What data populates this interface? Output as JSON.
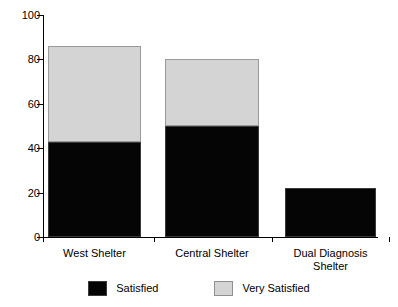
{
  "chart_data": {
    "type": "bar",
    "subtype": "stacked-vertical",
    "title": "",
    "subtitle": "",
    "xlabel": "",
    "ylabel": "",
    "categories": [
      "West Shelter",
      "Central Shelter",
      "Dual Diagnosis\nShelter"
    ],
    "series": [
      {
        "name": "Satisfied",
        "color": "#050505",
        "values": [
          43,
          50,
          22
        ]
      },
      {
        "name": "Very Satisfied",
        "color": "#d4d4d4",
        "values": [
          43,
          30,
          0
        ]
      }
    ],
    "totals": [
      86,
      80,
      22
    ],
    "ylim": [
      0,
      100
    ],
    "yticks": [
      0,
      20,
      40,
      60,
      80,
      100
    ],
    "ytick_labels": [
      "0",
      "20",
      "40",
      "60",
      "80",
      "100"
    ],
    "grid": false,
    "legend_position": "bottom",
    "legend": [
      {
        "label": "Satisfied",
        "swatch": "black"
      },
      {
        "label": "Very Satisfied",
        "swatch": "gray"
      }
    ]
  }
}
